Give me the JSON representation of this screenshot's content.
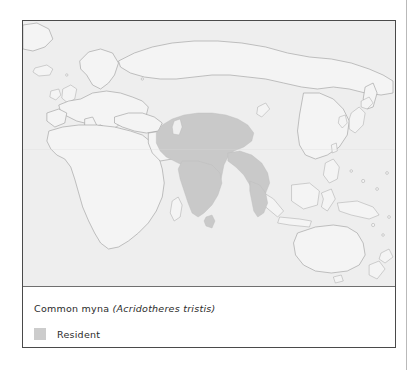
{
  "figure": {
    "type": "species-distribution-map",
    "caption": {
      "common_name": "Common myna",
      "scientific_name": "(Acridotheres tristis)"
    },
    "legend": {
      "items": [
        {
          "label": "Resident",
          "color": "#cccccc"
        }
      ]
    },
    "map": {
      "projection_extent": "Europe, Africa, Asia, Australasia and the western Pacific",
      "background_color": "#eeeeee",
      "land_fill": "#f4f4f4",
      "coastline_color": "#9a9a9a",
      "range_color": "#c9c9c9",
      "labels": [],
      "range_regions": [
        "Central Asia",
        "Iran",
        "Afghanistan",
        "Pakistan",
        "Indian subcontinent",
        "Sri Lanka",
        "Myanmar",
        "Thailand",
        "Indochina"
      ]
    },
    "frame": {
      "border_color": "#4a4a4a",
      "divider_color": "#6f6f6f"
    }
  }
}
